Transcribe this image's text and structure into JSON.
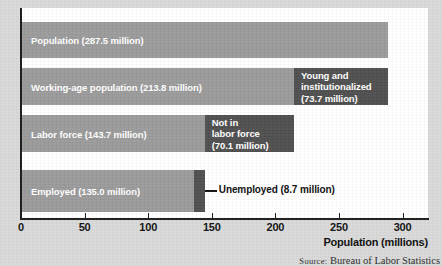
{
  "chart_data": {
    "type": "bar",
    "orientation": "horizontal",
    "title": "",
    "xlabel": "Population (millions)",
    "ylabel": "",
    "xlim": [
      0,
      320
    ],
    "xticks": [
      0,
      50,
      100,
      150,
      200,
      250,
      300
    ],
    "xtick_labels": [
      "0",
      "50",
      "100",
      "150",
      "200",
      "250",
      "300"
    ],
    "grid": false,
    "legend": false,
    "categories": [
      "Population",
      "Working-age population",
      "Labor force",
      "Employed"
    ],
    "values": [
      287.5,
      213.8,
      143.7,
      135.0
    ],
    "series": [
      {
        "name": "Main",
        "values": [
          287.5,
          213.8,
          143.7,
          135.0
        ],
        "color": "#9a9a9a"
      },
      {
        "name": "Residual",
        "values": [
          0,
          73.7,
          70.1,
          8.7
        ],
        "color": "#4f4f4f"
      }
    ],
    "annotations": [
      "Young and institutionalized (73.7 million)",
      "Not in labor force (70.1 million)",
      "Unemployed (8.7 million)"
    ],
    "source": "Source: Bureau of Labor Statistics"
  },
  "bars": [
    {
      "name": "population",
      "label": "Population (287.5 million)",
      "value": 287.5,
      "extra_value": 0,
      "extra_label_lines": []
    },
    {
      "name": "working-age-population",
      "label": "Working-age population (213.8 million)",
      "value": 213.8,
      "extra_value": 73.7,
      "extra_label_lines": [
        "Young and",
        "institutionalized",
        "(73.7 million)"
      ]
    },
    {
      "name": "labor-force",
      "label": "Labor force (143.7 million)",
      "value": 143.7,
      "extra_value": 70.1,
      "extra_label_lines": [
        "Not in",
        "labor force",
        "(70.1 million)"
      ]
    },
    {
      "name": "employed",
      "label": "Employed (135.0 million)",
      "value": 135.0,
      "extra_value": 8.7,
      "extra_label_lines": []
    }
  ],
  "callout": {
    "unemployed_label": "Unemployed (8.7 million)"
  },
  "axis": {
    "x_title": "Population (millions)",
    "ticks": [
      "0",
      "50",
      "100",
      "150",
      "200",
      "250",
      "300"
    ]
  },
  "source": {
    "prefix": "Source:",
    "text": " Bureau of Labor Statistics"
  },
  "colors": {
    "bar_main": "#9a9a9a",
    "bar_extra": "#4f4f4f",
    "plot_background": "#ffffff",
    "page_background": "#d9d9d9",
    "axis": "#1a1a1a",
    "bar_text": "#ffffff"
  }
}
